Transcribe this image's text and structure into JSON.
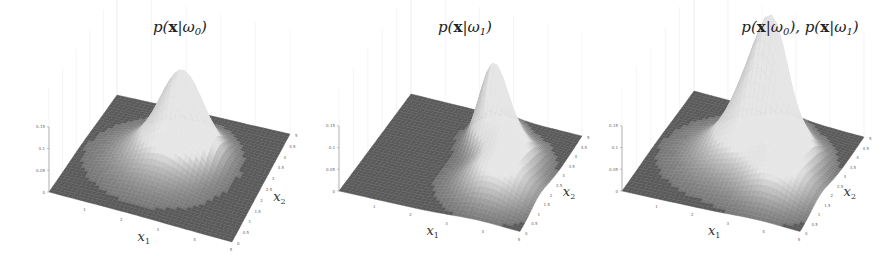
{
  "chart_data": [
    {
      "type": "surface3d",
      "title": "p(x|ω0)",
      "title_parts": [
        "p(",
        "x",
        "|ω",
        "0",
        ")"
      ],
      "xlabel": "x1",
      "ylabel": "x2",
      "zlabel": "",
      "xlim": [
        0,
        5
      ],
      "ylim": [
        0,
        5
      ],
      "zlim": [
        0,
        0.15
      ],
      "x_ticks": [
        "1",
        "2",
        "3",
        "4",
        "5"
      ],
      "y_ticks": [
        "0",
        "0.5",
        "1",
        "1.5",
        "2",
        "2.5",
        "3",
        "3.5",
        "4",
        "4.5",
        "5"
      ],
      "z_ticks": [
        "0",
        "0.05",
        "0.1",
        "0.15"
      ],
      "components": [
        {
          "mu": [
            2.6,
            3.1
          ],
          "sigma": [
            0.55,
            0.55
          ],
          "height": 0.16
        },
        {
          "mu": [
            2.2,
            2.4
          ],
          "sigma": [
            0.9,
            0.9
          ],
          "height": 0.05
        }
      ]
    },
    {
      "type": "surface3d",
      "title": "p(x|ω1)",
      "title_parts": [
        "p(",
        "x",
        "|ω",
        "1",
        ")"
      ],
      "xlabel": "x1",
      "ylabel": "x2",
      "zlabel": "",
      "xlim": [
        0,
        5
      ],
      "ylim": [
        0,
        5
      ],
      "zlim": [
        0,
        0.15
      ],
      "x_ticks": [
        "1",
        "2",
        "3",
        "4",
        "5"
      ],
      "y_ticks": [
        "0",
        "0.5",
        "1",
        "1.5",
        "2",
        "2.5",
        "3",
        "3.5",
        "4",
        "4.5",
        "5"
      ],
      "z_ticks": [
        "0",
        "0.05",
        "0.1",
        "0.15"
      ],
      "components": [
        {
          "mu": [
            2.9,
            3.7
          ],
          "sigma": [
            0.35,
            0.5
          ],
          "height": 0.17
        },
        {
          "mu": [
            3.6,
            3.0
          ],
          "sigma": [
            0.5,
            0.6
          ],
          "height": 0.08
        },
        {
          "mu": [
            3.8,
            1.6
          ],
          "sigma": [
            0.7,
            0.7
          ],
          "height": 0.07
        }
      ]
    },
    {
      "type": "surface3d",
      "title": "p(x|ω0), p(x|ω1)",
      "title_parts": [
        "p(",
        "x",
        "|ω",
        "0",
        "), p(",
        "x",
        "|ω",
        "1",
        ")"
      ],
      "xlabel": "x1",
      "ylabel": "x2",
      "zlabel": "",
      "xlim": [
        0,
        5
      ],
      "ylim": [
        0,
        5
      ],
      "zlim": [
        0,
        0.15
      ],
      "x_ticks": [
        "1",
        "2",
        "3",
        "4",
        "5"
      ],
      "y_ticks": [
        "0",
        "0.5",
        "1",
        "1.5",
        "2",
        "2.5",
        "3",
        "3.5",
        "4",
        "4.5",
        "5"
      ],
      "z_ticks": [
        "0",
        "0.05",
        "0.1",
        "0.15"
      ],
      "components": [
        {
          "mu": [
            2.6,
            3.1
          ],
          "sigma": [
            0.55,
            0.55
          ],
          "height": 0.16
        },
        {
          "mu": [
            2.2,
            2.4
          ],
          "sigma": [
            0.9,
            0.9
          ],
          "height": 0.05
        },
        {
          "mu": [
            2.9,
            3.7
          ],
          "sigma": [
            0.35,
            0.5
          ],
          "height": 0.17
        },
        {
          "mu": [
            3.6,
            3.0
          ],
          "sigma": [
            0.5,
            0.6
          ],
          "height": 0.08
        },
        {
          "mu": [
            3.8,
            1.6
          ],
          "sigma": [
            0.7,
            0.7
          ],
          "height": 0.07
        }
      ]
    }
  ],
  "colors": {
    "floor": "#555555",
    "surface_high": "#e6e6e6",
    "surface_low": "#5a5a5a",
    "grid": "#ececec",
    "axis": "#888888"
  }
}
